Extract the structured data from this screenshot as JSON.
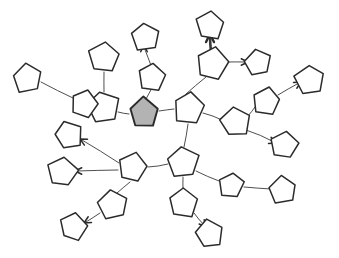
{
  "figure": {
    "background_color": "#ffffff",
    "stroke_color": "#2b2b2b",
    "edge_color": "#3a3a3a",
    "highlight_fill": "#b3b3b3",
    "node_shape": "pentagon",
    "node_count": 31,
    "edge_count": 30,
    "highlighted_node_id": "n-root"
  },
  "nodes": [
    {
      "id": "n-root",
      "label": "root",
      "cx": 144,
      "cy": 113,
      "r": 15,
      "rot": 0,
      "filled": true
    },
    {
      "id": "n-hub-a",
      "label": "hub-a",
      "cx": 189,
      "cy": 108,
      "r": 16,
      "rot": 8,
      "filled": false
    },
    {
      "id": "n-hub-b",
      "label": "hub-b",
      "cx": 183,
      "cy": 162,
      "r": 16,
      "rot": -4,
      "filled": false
    },
    {
      "id": "n-hub-c",
      "label": "hub-c",
      "cx": 133,
      "cy": 168,
      "r": 15,
      "rot": 14,
      "filled": false
    },
    {
      "id": "n-hub-d",
      "label": "hub-d",
      "cx": 103,
      "cy": 107,
      "r": 16,
      "rot": -10,
      "filled": false
    },
    {
      "id": "n-hub-e",
      "label": "hub-e",
      "cx": 212,
      "cy": 64,
      "r": 16,
      "rot": 12,
      "filled": false
    },
    {
      "id": "n-hub-f",
      "label": "hub-f",
      "cx": 235,
      "cy": 122,
      "r": 15,
      "rot": -8,
      "filled": false
    },
    {
      "id": "n01",
      "label": "n01",
      "cx": 152,
      "cy": 77,
      "r": 14,
      "rot": 6,
      "filled": false
    },
    {
      "id": "n02",
      "label": "n02",
      "cx": 145,
      "cy": 37,
      "r": 15,
      "rot": -6,
      "filled": false
    },
    {
      "id": "n03",
      "label": "n03",
      "cx": 210,
      "cy": 25,
      "r": 15,
      "rot": 4,
      "filled": false
    },
    {
      "id": "n04",
      "label": "n04",
      "cx": 258,
      "cy": 63,
      "r": 14,
      "rot": -12,
      "filled": false
    },
    {
      "id": "n05",
      "label": "n05",
      "cx": 266,
      "cy": 101,
      "r": 15,
      "rot": 10,
      "filled": false
    },
    {
      "id": "n06",
      "label": "n06",
      "cx": 310,
      "cy": 80,
      "r": 15,
      "rot": -5,
      "filled": false
    },
    {
      "id": "n07",
      "label": "n07",
      "cx": 284,
      "cy": 145,
      "r": 14,
      "rot": 8,
      "filled": false
    },
    {
      "id": "n08",
      "label": "n08",
      "cx": 84,
      "cy": 104,
      "r": 14,
      "rot": 16,
      "filled": false
    },
    {
      "id": "n09",
      "label": "n09",
      "cx": 27,
      "cy": 78,
      "r": 15,
      "rot": -8,
      "filled": false
    },
    {
      "id": "n10",
      "label": "n10",
      "cx": 104,
      "cy": 57,
      "r": 16,
      "rot": 5,
      "filled": false
    },
    {
      "id": "n11",
      "label": "n11",
      "cx": 68,
      "cy": 135,
      "r": 14,
      "rot": -14,
      "filled": false
    },
    {
      "id": "n12",
      "label": "n12",
      "cx": 62,
      "cy": 172,
      "r": 15,
      "rot": 9,
      "filled": false
    },
    {
      "id": "n13",
      "label": "n13",
      "cx": 113,
      "cy": 205,
      "r": 15,
      "rot": -7,
      "filled": false
    },
    {
      "id": "n14",
      "label": "n14",
      "cx": 73,
      "cy": 227,
      "r": 14,
      "rot": 12,
      "filled": false
    },
    {
      "id": "n15",
      "label": "n15",
      "cx": 183,
      "cy": 203,
      "r": 15,
      "rot": 3,
      "filled": false
    },
    {
      "id": "n16",
      "label": "n16",
      "cx": 209,
      "cy": 234,
      "r": 14,
      "rot": -10,
      "filled": false
    },
    {
      "id": "n17",
      "label": "n17",
      "cx": 231,
      "cy": 185,
      "r": 13,
      "rot": 7,
      "filled": false
    },
    {
      "id": "n18",
      "label": "n18",
      "cx": 283,
      "cy": 190,
      "r": 14,
      "rot": -6,
      "filled": false
    }
  ],
  "edges": [
    {
      "id": "e01",
      "source": "n-root",
      "target": "n-hub-a",
      "x1": 159,
      "y1": 111,
      "x2": 174,
      "y2": 109,
      "thick": false,
      "arrow": "none"
    },
    {
      "id": "e02",
      "source": "n-root",
      "target": "n01",
      "x1": 146,
      "y1": 99,
      "x2": 152,
      "y2": 88,
      "thick": false,
      "arrow": "none"
    },
    {
      "id": "e03",
      "source": "n01",
      "target": "n02",
      "x1": 152,
      "y1": 68,
      "x2": 144,
      "y2": 47,
      "thick": false,
      "arrow": "up"
    },
    {
      "id": "e04",
      "source": "n-root",
      "target": "n-hub-d",
      "x1": 129,
      "y1": 114,
      "x2": 118,
      "y2": 112,
      "thick": false,
      "arrow": "none"
    },
    {
      "id": "e05",
      "source": "n-hub-a",
      "target": "n-hub-e",
      "x1": 186,
      "y1": 94,
      "x2": 206,
      "y2": 77,
      "thick": false,
      "arrow": "none"
    },
    {
      "id": "e06",
      "source": "n-hub-e",
      "target": "n03",
      "x1": 211,
      "y1": 52,
      "x2": 210,
      "y2": 36,
      "thick": true,
      "arrow": "up"
    },
    {
      "id": "e07",
      "source": "n-hub-e",
      "target": "n04",
      "x1": 227,
      "y1": 62,
      "x2": 246,
      "y2": 62,
      "thick": false,
      "arrow": "right"
    },
    {
      "id": "e08",
      "source": "n-hub-a",
      "target": "n-hub-f",
      "x1": 203,
      "y1": 113,
      "x2": 222,
      "y2": 120,
      "thick": false,
      "arrow": "none"
    },
    {
      "id": "e09",
      "source": "n-hub-f",
      "target": "n05",
      "x1": 248,
      "y1": 116,
      "x2": 255,
      "y2": 107,
      "thick": false,
      "arrow": "none"
    },
    {
      "id": "e10",
      "source": "n05",
      "target": "n06",
      "x1": 278,
      "y1": 95,
      "x2": 299,
      "y2": 83,
      "thick": false,
      "arrow": "rightup"
    },
    {
      "id": "e11",
      "source": "n-hub-f",
      "target": "n07",
      "x1": 246,
      "y1": 130,
      "x2": 274,
      "y2": 142,
      "thick": false,
      "arrow": "rightdn"
    },
    {
      "id": "e12",
      "source": "n-hub-a",
      "target": "n-hub-b",
      "x1": 188,
      "y1": 124,
      "x2": 184,
      "y2": 147,
      "thick": false,
      "arrow": "none"
    },
    {
      "id": "e13",
      "source": "n-hub-d",
      "target": "n08",
      "x1": 92,
      "y1": 106,
      "x2": 96,
      "y2": 106,
      "thick": false,
      "arrow": "none"
    },
    {
      "id": "e14",
      "source": "n08",
      "target": "n09",
      "x1": 73,
      "y1": 98,
      "x2": 41,
      "y2": 82,
      "thick": false,
      "arrow": "none"
    },
    {
      "id": "e15",
      "source": "n-hub-d",
      "target": "n10",
      "x1": 104,
      "y1": 92,
      "x2": 104,
      "y2": 72,
      "thick": false,
      "arrow": "none"
    },
    {
      "id": "e16",
      "source": "n-hub-c",
      "target": "n11",
      "x1": 119,
      "y1": 163,
      "x2": 82,
      "y2": 140,
      "thick": false,
      "arrow": "leftup"
    },
    {
      "id": "e17",
      "source": "n-hub-c",
      "target": "n12",
      "x1": 118,
      "y1": 170,
      "x2": 77,
      "y2": 171,
      "thick": false,
      "arrow": "left"
    },
    {
      "id": "e18",
      "source": "n-hub-c",
      "target": "n13",
      "x1": 130,
      "y1": 182,
      "x2": 117,
      "y2": 193,
      "thick": false,
      "arrow": "none"
    },
    {
      "id": "e19",
      "source": "n13",
      "target": "n14",
      "x1": 100,
      "y1": 213,
      "x2": 86,
      "y2": 222,
      "thick": false,
      "arrow": "leftdn"
    },
    {
      "id": "e20",
      "source": "n-hub-c",
      "target": "n-hub-b",
      "x1": 148,
      "y1": 167,
      "x2": 168,
      "y2": 164,
      "thick": false,
      "arrow": "none"
    },
    {
      "id": "e21",
      "source": "n-hub-b",
      "target": "n15",
      "x1": 183,
      "y1": 177,
      "x2": 183,
      "y2": 190,
      "thick": false,
      "arrow": "none"
    },
    {
      "id": "e22",
      "source": "n15",
      "target": "n16",
      "x1": 194,
      "y1": 213,
      "x2": 204,
      "y2": 225,
      "thick": false,
      "arrow": "rightdn"
    },
    {
      "id": "e23",
      "source": "n-hub-b",
      "target": "n17",
      "x1": 196,
      "y1": 171,
      "x2": 219,
      "y2": 181,
      "thick": false,
      "arrow": "none"
    },
    {
      "id": "e24",
      "source": "n17",
      "target": "n18",
      "x1": 244,
      "y1": 187,
      "x2": 271,
      "y2": 189,
      "thick": false,
      "arrow": "right"
    }
  ],
  "arrows": [
    {
      "id": "a01",
      "on_edge": "e03",
      "tip_x": 144,
      "tip_y": 45,
      "angle": -90,
      "thick": false
    },
    {
      "id": "a02",
      "on_edge": "e06",
      "tip_x": 210,
      "tip_y": 34,
      "angle": -90,
      "thick": true
    },
    {
      "id": "a03",
      "on_edge": "e07",
      "tip_x": 248,
      "tip_y": 62,
      "angle": 0,
      "thick": false
    },
    {
      "id": "a04",
      "on_edge": "e10",
      "tip_x": 301,
      "tip_y": 82,
      "angle": -30,
      "thick": false
    },
    {
      "id": "a05",
      "on_edge": "e11",
      "tip_x": 276,
      "tip_y": 143,
      "angle": 23,
      "thick": false
    },
    {
      "id": "a06",
      "on_edge": "e16",
      "tip_x": 80,
      "tip_y": 139,
      "angle": 208,
      "thick": false
    },
    {
      "id": "a07",
      "on_edge": "e17",
      "tip_x": 75,
      "tip_y": 171,
      "angle": 180,
      "thick": false
    },
    {
      "id": "a08",
      "on_edge": "e19",
      "tip_x": 84,
      "tip_y": 223,
      "angle": 150,
      "thick": false
    },
    {
      "id": "a09",
      "on_edge": "e22",
      "tip_x": 206,
      "tip_y": 227,
      "angle": 50,
      "thick": false
    }
  ]
}
